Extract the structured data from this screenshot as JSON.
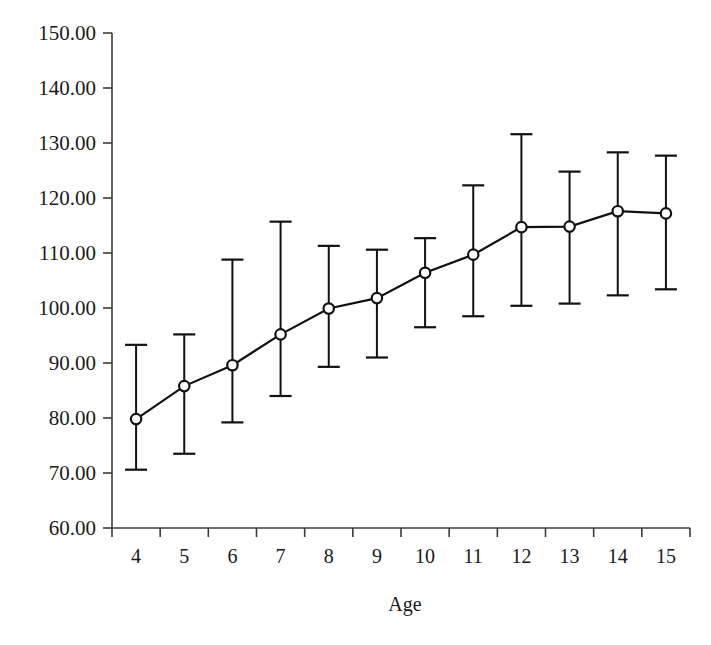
{
  "chart_data": {
    "type": "line",
    "title": "",
    "subtitle": "",
    "xlabel": "Age",
    "ylabel": "",
    "categories": [
      "4",
      "5",
      "6",
      "7",
      "8",
      "9",
      "10",
      "11",
      "12",
      "13",
      "14",
      "15"
    ],
    "x": [
      4,
      5,
      6,
      7,
      8,
      9,
      10,
      11,
      12,
      13,
      14,
      15
    ],
    "values": [
      79.8,
      85.8,
      89.6,
      95.2,
      99.9,
      101.8,
      106.4,
      109.7,
      114.7,
      114.8,
      117.6,
      117.2
    ],
    "error_upper": [
      93.3,
      95.2,
      108.8,
      115.7,
      111.3,
      110.6,
      112.7,
      122.3,
      131.6,
      124.8,
      128.3,
      127.7
    ],
    "error_lower": [
      70.6,
      73.5,
      79.2,
      84.0,
      89.3,
      91.0,
      96.5,
      98.5,
      100.4,
      100.8,
      102.3,
      103.4
    ],
    "ylim": [
      60,
      150
    ],
    "ytick_values": [
      60,
      70,
      80,
      90,
      100,
      110,
      120,
      130,
      140,
      150
    ],
    "ytick_labels": [
      "60.00",
      "70.00",
      "80.00",
      "90.00",
      "100.00",
      "110.00",
      "120.00",
      "130.00",
      "140.00",
      "150.00"
    ],
    "xtick_labels": [
      "4",
      "5",
      "6",
      "7",
      "8",
      "9",
      "10",
      "11",
      "12",
      "13",
      "14",
      "15"
    ],
    "grid": false,
    "legend": null,
    "legend_position": "none",
    "marker": "open-circle",
    "line_color": "#111111",
    "marker_fill": "#ffffff",
    "marker_stroke": "#111111",
    "axis_color": "#3c3c3c",
    "background": "#ffffff",
    "annotations": []
  },
  "labels": {
    "x_axis_title": "Age"
  }
}
